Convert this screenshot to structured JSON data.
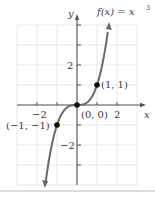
{
  "chart_data": {
    "type": "line",
    "function_label": "f(x) = x",
    "function_exponent": "3",
    "xlabel": "x",
    "ylabel": "y",
    "xlim": [
      -3,
      3
    ],
    "ylim": [
      -4,
      4
    ],
    "grid": true,
    "x_tick_labels": [
      {
        "value": -2,
        "label": "−2"
      },
      {
        "value": 2,
        "label": "2"
      }
    ],
    "y_tick_labels": [
      {
        "value": 2,
        "label": "2"
      },
      {
        "value": -2,
        "label": "−2"
      }
    ],
    "series": [
      {
        "name": "f(x) = x^3",
        "x": [
          -1.59,
          -1.5,
          -1.25,
          -1,
          -0.75,
          -0.5,
          -0.25,
          0,
          0.25,
          0.5,
          0.75,
          1,
          1.25,
          1.5,
          1.59
        ],
        "y": [
          -4.0,
          -3.375,
          -1.953,
          -1,
          -0.422,
          -0.125,
          -0.016,
          0,
          0.016,
          0.125,
          0.422,
          1,
          1.953,
          3.375,
          4.0
        ]
      }
    ],
    "points": [
      {
        "x": -1,
        "y": -1,
        "label": "(−1, −1)"
      },
      {
        "x": 0,
        "y": 0,
        "label": "(0, 0)"
      },
      {
        "x": 1,
        "y": 1,
        "label": "(1, 1)"
      }
    ]
  }
}
